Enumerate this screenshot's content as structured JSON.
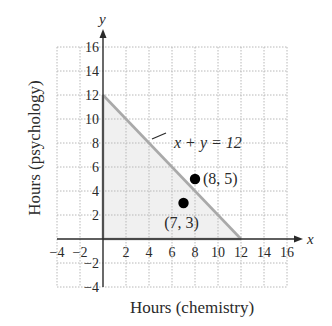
{
  "chart_data": {
    "type": "scatter",
    "title": "",
    "xlabel": "Hours (chemistry)",
    "ylabel": "Hours (psychology)",
    "x_axis_var": "x",
    "y_axis_var": "y",
    "xlim": [
      -4,
      16
    ],
    "ylim": [
      -4,
      16
    ],
    "grid": true,
    "grid_step": 2,
    "x_ticks": [
      -4,
      -2,
      2,
      4,
      6,
      8,
      10,
      12,
      14,
      16
    ],
    "y_ticks": [
      -4,
      -2,
      2,
      4,
      6,
      8,
      10,
      12,
      14,
      16
    ],
    "x_tick_labels": [
      "−4",
      "−2",
      "2",
      "4",
      "6",
      "8",
      "10",
      "12",
      "14",
      "16"
    ],
    "y_tick_labels": [
      "−4",
      "−2",
      "2",
      "4",
      "6",
      "8",
      "10",
      "12",
      "14",
      "16"
    ],
    "line": {
      "equation": "x + y = 12",
      "label": "x + y = 12",
      "points": [
        [
          0,
          12
        ],
        [
          12,
          0
        ]
      ],
      "color": "#a9a9a9"
    },
    "shaded_region": {
      "description": "x >= 0, y >= 0, x + y <= 12",
      "vertices": [
        [
          0,
          0
        ],
        [
          12,
          0
        ],
        [
          0,
          12
        ]
      ],
      "color": "#f0f0f0"
    },
    "series": [
      {
        "name": "points",
        "points": [
          {
            "x": 8,
            "y": 5,
            "label": "(8, 5)"
          },
          {
            "x": 7,
            "y": 3,
            "label": "(7, 3)"
          }
        ],
        "color": "#000000"
      }
    ],
    "legend": null
  },
  "colors": {
    "axis": "#2a2a2a",
    "grid": "#b8b8b8",
    "line": "#a9a9a9",
    "shade": "#f0f0f0",
    "point": "#000000"
  }
}
